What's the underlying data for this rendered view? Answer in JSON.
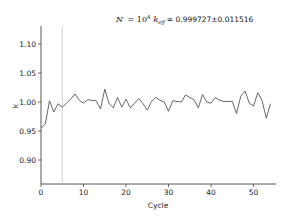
{
  "chart_data": {
    "type": "line",
    "title_parts": {
      "n_label": "N",
      "n_value": "10",
      "n_exp": "4",
      "k_label": "k",
      "k_sub": "eff",
      "value": "= 0.999727±0.011516"
    },
    "xlabel": "Cycle",
    "ylabel": "k",
    "xlim": [
      0,
      55
    ],
    "ylim": [
      0.86,
      1.13
    ],
    "xticks": [
      0,
      10,
      20,
      30,
      40,
      50
    ],
    "xtick_labels": [
      "0",
      "10",
      "20",
      "30",
      "40",
      "50"
    ],
    "yticks": [
      0.9,
      0.95,
      1.0,
      1.05,
      1.1
    ],
    "ytick_labels": [
      "0.90",
      "0.95",
      "1.00",
      "1.05",
      "1.10"
    ],
    "grid": false,
    "legend": null,
    "annotations": [
      {
        "type": "vline",
        "x": 5,
        "color": "#cccccc",
        "note": "end of inactive cycles"
      }
    ],
    "series": [
      {
        "name": "k",
        "color": "#555555",
        "x": [
          0,
          1,
          2,
          3,
          4,
          5,
          6,
          7,
          8,
          9,
          10,
          11,
          12,
          13,
          14,
          15,
          16,
          17,
          18,
          19,
          20,
          21,
          22,
          23,
          24,
          25,
          26,
          27,
          28,
          29,
          30,
          31,
          32,
          33,
          34,
          35,
          36,
          37,
          38,
          39,
          40,
          41,
          42,
          43,
          44,
          45,
          46,
          47,
          48,
          49,
          50,
          51,
          52,
          53,
          54
        ],
        "values": [
          0.955,
          0.962,
          1.002,
          0.983,
          0.997,
          0.991,
          0.998,
          1.005,
          1.014,
          1.003,
          0.998,
          1.004,
          1.003,
          1.002,
          0.988,
          1.022,
          0.998,
          0.99,
          1.008,
          0.991,
          1.005,
          0.99,
          0.998,
          1.006,
          0.997,
          0.986,
          1.001,
          1.008,
          1.003,
          1.0,
          0.984,
          1.002,
          1.001,
          1.0,
          1.012,
          1.008,
          1.004,
          0.99,
          1.013,
          1.0,
          0.998,
          1.008,
          1.003,
          1.001,
          1.001,
          1.001,
          0.98,
          1.01,
          1.019,
          0.998,
          0.993,
          1.016,
          1.003,
          0.972,
          0.997
        ]
      }
    ]
  }
}
